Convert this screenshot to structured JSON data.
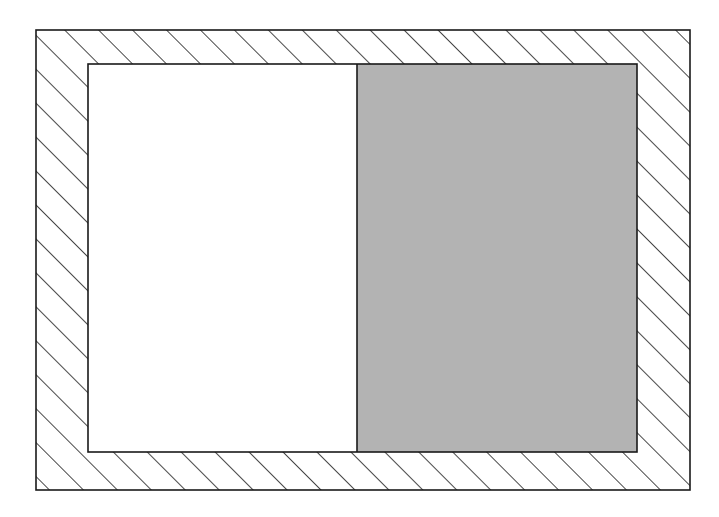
{
  "figure": {
    "background_color": "#ffffff",
    "line_color": "#1a1a1a",
    "ghost_header_text": "",
    "ghost_footer_text": ""
  },
  "chart_data": {
    "type": "diagram",
    "width": 719,
    "height": 517,
    "regions": [
      {
        "name": "outer-frame",
        "label": "Hatched border frame",
        "fill": "hatch-45",
        "fill_color": "#ffffff",
        "stroke": "#1a1a1a",
        "stroke_width": 1.6,
        "x": 36,
        "y": 30,
        "width": 654,
        "height": 460
      },
      {
        "name": "inner-cavity",
        "label": "Inner cavity",
        "x": 88,
        "y": 64,
        "width": 549,
        "height": 388,
        "stroke": "#1a1a1a",
        "stroke_width": 1.6
      },
      {
        "name": "inner-left-white",
        "label": "Left white region",
        "fill_color": "#ffffff",
        "x": 88,
        "y": 64,
        "width": 269,
        "height": 388
      },
      {
        "name": "inner-right-gray",
        "label": "Right gray region",
        "fill_color": "#b3b3b3",
        "x": 357,
        "y": 64,
        "width": 280,
        "height": 388
      }
    ],
    "divider": {
      "name": "region-divider",
      "orientation": "vertical",
      "x": 357,
      "y_start": 64,
      "y_end": 452,
      "stroke": "#1a1a1a",
      "stroke_width": 1.6
    },
    "hatching": {
      "angle_degrees": 45,
      "direction": "bottom-left-to-top-right",
      "spacing_px": 24,
      "stroke": "#1a1a1a",
      "stroke_width": 1.6
    }
  }
}
